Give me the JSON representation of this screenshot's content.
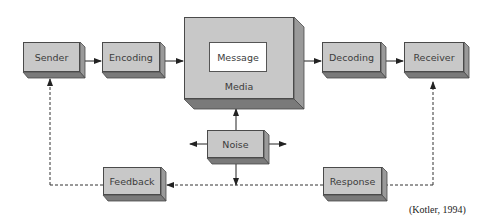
{
  "diagram": {
    "nodes": {
      "sender": "Sender",
      "encoding": "Encoding",
      "message": "Message",
      "media": "Media",
      "decoding": "Decoding",
      "receiver": "Receiver",
      "noise": "Noise",
      "feedback": "Feedback",
      "response": "Response"
    },
    "edges": [
      {
        "from": "Sender",
        "to": "Encoding",
        "style": "solid"
      },
      {
        "from": "Encoding",
        "to": "Media",
        "style": "solid"
      },
      {
        "from": "Media",
        "to": "Decoding",
        "style": "solid"
      },
      {
        "from": "Decoding",
        "to": "Receiver",
        "style": "solid"
      },
      {
        "from": "Receiver",
        "to": "Response",
        "style": "dashed"
      },
      {
        "from": "Response",
        "to": "Feedback",
        "style": "dashed"
      },
      {
        "from": "Feedback",
        "to": "Sender",
        "style": "dashed"
      },
      {
        "from": "Noise",
        "to": "Media",
        "style": "solid"
      },
      {
        "from": "Noise",
        "to": "left",
        "style": "solid"
      },
      {
        "from": "Noise",
        "to": "right",
        "style": "solid"
      },
      {
        "from": "Noise",
        "to": "feedback-loop",
        "style": "solid"
      }
    ],
    "citation": "(Kotler, 1994)"
  },
  "colors": {
    "box_face": "#c8c8c8",
    "box_side": "#9a9a9a",
    "box_bottom": "#7a7a7a",
    "border": "#4a4a4a",
    "message_bg": "#ffffff",
    "arrow": "#222222"
  }
}
